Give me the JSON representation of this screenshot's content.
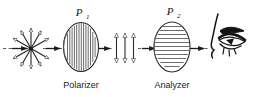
{
  "figure": {
    "background_color": "#ffffff",
    "ink_color": "#1a1a1a",
    "width": 254,
    "height": 97
  },
  "labels": {
    "p1_base": "P",
    "p1_sub": "1",
    "p2_base": "P",
    "p2_sub": "2",
    "polarizer_caption": "Polarizer",
    "analyzer_caption": "Analyzer"
  },
  "elements": {
    "unpolarized_source": {
      "name": "unpolarized-light-starburst",
      "ray_count": 12,
      "description": "radial double arrows indicating unpolarized light"
    },
    "polarizer_disc": {
      "name": "polarizer-disc",
      "hatch_orientation": "vertical",
      "hatch_count": 13
    },
    "polarized_beam": {
      "name": "vertically-polarized-beam",
      "arrow_count": 3,
      "orientation": "vertical"
    },
    "analyzer_disc": {
      "name": "analyzer-disc",
      "hatch_orientation": "horizontal",
      "hatch_count": 11
    },
    "observer_eye": {
      "name": "observer-eye",
      "description": "human eye viewing along optic axis"
    },
    "optic_axis": {
      "name": "optic-axis",
      "style": "dashed",
      "arrow_heads": 4
    }
  }
}
